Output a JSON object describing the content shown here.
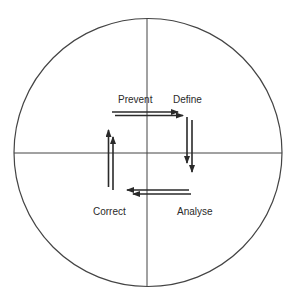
{
  "diagram": {
    "title": "",
    "quadrants": {
      "top_left": "Prevent",
      "top_right": "Define",
      "bottom_right": "Analyse",
      "bottom_left": "Correct"
    },
    "cycle_order": [
      "Define",
      "Analyse",
      "Correct",
      "Prevent"
    ],
    "colors": {
      "line": "#333333",
      "text": "#2a2a2a",
      "background": "#ffffff"
    }
  }
}
